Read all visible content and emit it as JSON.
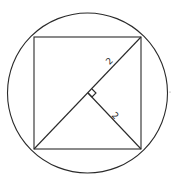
{
  "diagram": {
    "title": "",
    "shapes": [
      "circle",
      "inscribed-square",
      "diagonal",
      "perpendicular-segment",
      "right-angle-marker"
    ],
    "labels": {
      "diagonal_half": "2",
      "perpendicular": "2"
    },
    "colors": {
      "line": "#2a2a2a",
      "background": "#ffffff"
    }
  }
}
